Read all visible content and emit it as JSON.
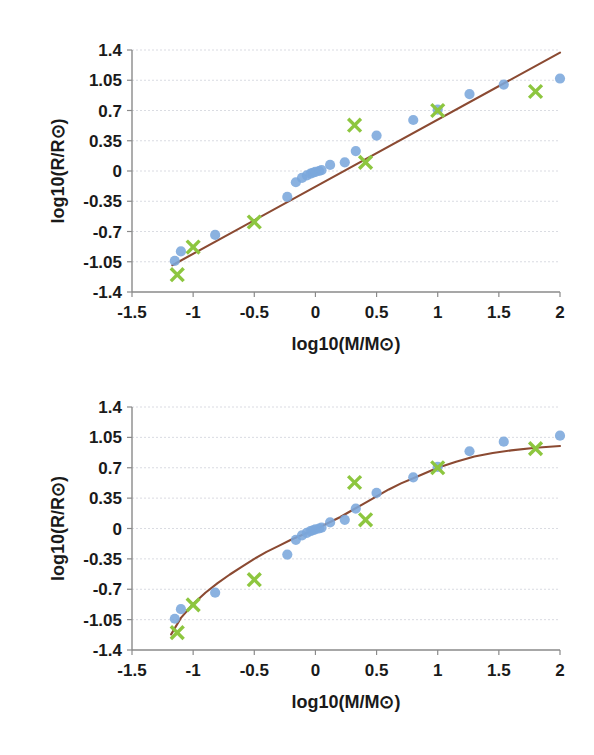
{
  "page": {
    "background_color": "#ffffff",
    "figure_count": 2
  },
  "style": {
    "observed_dot_color": "#7BA7DC",
    "model_x_color": "#8DC63F",
    "fit_line_color": "#8B4A32",
    "gridline_color": "#c9ccd6",
    "axis_color": "#8a8a8a",
    "text_color": "#1a1a1a"
  },
  "chart_data": [
    {
      "id": "top",
      "type": "scatter",
      "title": "",
      "xlabel": "log10(M/M⊙)",
      "ylabel": "log10(R/R⊙)",
      "xlim": [
        -1.5,
        2
      ],
      "ylim": [
        -1.4,
        1.4
      ],
      "xticks": [
        -1.5,
        -1,
        -0.5,
        0,
        0.5,
        1,
        1.5,
        2
      ],
      "xtick_labels": [
        "-1.5",
        "-1",
        "-0.5",
        "0",
        "0.5",
        "1",
        "1.5",
        "2"
      ],
      "yticks": [
        1.4,
        1.05,
        0.7,
        0.35,
        0,
        -0.35,
        -0.7,
        -1.05,
        -1.4
      ],
      "ytick_labels": [
        "1.4",
        "1.05",
        "0.7",
        "0.35",
        "0",
        "-0.35",
        "-0.7",
        "-1.05",
        "-1.4"
      ],
      "grid": true,
      "grid_axis": "y",
      "legend": "none",
      "series": [
        {
          "name": "observed",
          "marker": "circle",
          "color": "#7BA7DC",
          "points": [
            [
              -1.15,
              -1.04
            ],
            [
              -1.1,
              -0.93
            ],
            [
              -0.82,
              -0.74
            ],
            [
              -0.23,
              -0.3
            ],
            [
              -0.16,
              -0.13
            ],
            [
              -0.11,
              -0.08
            ],
            [
              -0.07,
              -0.05
            ],
            [
              -0.04,
              -0.03
            ],
            [
              -0.02,
              -0.02
            ],
            [
              0.0,
              -0.01
            ],
            [
              0.03,
              0.0
            ],
            [
              0.05,
              0.01
            ],
            [
              0.12,
              0.07
            ],
            [
              0.24,
              0.1
            ],
            [
              0.33,
              0.23
            ],
            [
              0.5,
              0.41
            ],
            [
              0.8,
              0.59
            ],
            [
              1.0,
              0.71
            ],
            [
              1.26,
              0.89
            ],
            [
              1.54,
              1.0
            ],
            [
              2.0,
              1.07
            ]
          ]
        },
        {
          "name": "model",
          "marker": "x",
          "color": "#8DC63F",
          "points": [
            [
              -1.13,
              -1.2
            ],
            [
              -1.0,
              -0.88
            ],
            [
              -0.5,
              -0.59
            ],
            [
              0.32,
              0.53
            ],
            [
              0.41,
              0.1
            ],
            [
              1.0,
              0.7
            ],
            [
              1.8,
              0.92
            ]
          ]
        }
      ],
      "fit": {
        "name": "linear-fit",
        "type": "line",
        "color": "#8B4A32",
        "x_start": -1.17,
        "x_end": 2.0,
        "y_start": -1.09,
        "y_end": 1.37
      }
    },
    {
      "id": "bottom",
      "type": "scatter",
      "title": "",
      "xlabel": "log10(M/M⊙)",
      "ylabel": "log10(R/R⊙)",
      "xlim": [
        -1.5,
        2
      ],
      "ylim": [
        -1.4,
        1.4
      ],
      "xticks": [
        -1.5,
        -1,
        -0.5,
        0,
        0.5,
        1,
        1.5,
        2
      ],
      "xtick_labels": [
        "-1.5",
        "-1",
        "-0.5",
        "0",
        "0.5",
        "1",
        "1.5",
        "2"
      ],
      "yticks": [
        1.4,
        1.05,
        0.7,
        0.35,
        0,
        -0.35,
        -0.7,
        -1.05,
        -1.4
      ],
      "ytick_labels": [
        "1.4",
        "1.05",
        "0.7",
        "0.35",
        "0",
        "-0.35",
        "-0.7",
        "-1.05",
        "-1.4"
      ],
      "grid": true,
      "grid_axis": "y",
      "legend": "none",
      "series": [
        {
          "name": "observed",
          "marker": "circle",
          "color": "#7BA7DC",
          "points": [
            [
              -1.15,
              -1.04
            ],
            [
              -1.1,
              -0.93
            ],
            [
              -0.82,
              -0.74
            ],
            [
              -0.23,
              -0.3
            ],
            [
              -0.16,
              -0.13
            ],
            [
              -0.11,
              -0.08
            ],
            [
              -0.07,
              -0.05
            ],
            [
              -0.04,
              -0.03
            ],
            [
              -0.02,
              -0.02
            ],
            [
              0.0,
              -0.01
            ],
            [
              0.03,
              0.0
            ],
            [
              0.05,
              0.01
            ],
            [
              0.12,
              0.07
            ],
            [
              0.24,
              0.1
            ],
            [
              0.33,
              0.23
            ],
            [
              0.5,
              0.41
            ],
            [
              0.8,
              0.59
            ],
            [
              1.0,
              0.71
            ],
            [
              1.26,
              0.89
            ],
            [
              1.54,
              1.0
            ],
            [
              2.0,
              1.07
            ]
          ]
        },
        {
          "name": "model",
          "marker": "x",
          "color": "#8DC63F",
          "points": [
            [
              -1.13,
              -1.2
            ],
            [
              -1.0,
              -0.88
            ],
            [
              -0.5,
              -0.59
            ],
            [
              0.32,
              0.53
            ],
            [
              0.41,
              0.1
            ],
            [
              1.0,
              0.7
            ],
            [
              1.8,
              0.92
            ]
          ]
        }
      ],
      "fit": {
        "name": "curved-fit",
        "type": "curve",
        "color": "#8B4A32",
        "x_start": -1.18,
        "x_end": 2.0,
        "curve_points": [
          [
            -1.18,
            -1.22
          ],
          [
            -1.1,
            -1.03
          ],
          [
            -1.0,
            -0.87
          ],
          [
            -0.9,
            -0.74
          ],
          [
            -0.8,
            -0.63
          ],
          [
            -0.7,
            -0.53
          ],
          [
            -0.6,
            -0.44
          ],
          [
            -0.5,
            -0.35
          ],
          [
            -0.4,
            -0.27
          ],
          [
            -0.3,
            -0.2
          ],
          [
            -0.2,
            -0.13
          ],
          [
            -0.1,
            -0.07
          ],
          [
            0.0,
            -0.01
          ],
          [
            0.1,
            0.06
          ],
          [
            0.2,
            0.13
          ],
          [
            0.3,
            0.21
          ],
          [
            0.4,
            0.29
          ],
          [
            0.5,
            0.37
          ],
          [
            0.6,
            0.45
          ],
          [
            0.7,
            0.52
          ],
          [
            0.8,
            0.58
          ],
          [
            0.9,
            0.64
          ],
          [
            1.0,
            0.7
          ],
          [
            1.15,
            0.77
          ],
          [
            1.3,
            0.83
          ],
          [
            1.45,
            0.87
          ],
          [
            1.6,
            0.9
          ],
          [
            1.8,
            0.93
          ],
          [
            2.0,
            0.95
          ]
        ]
      }
    }
  ]
}
